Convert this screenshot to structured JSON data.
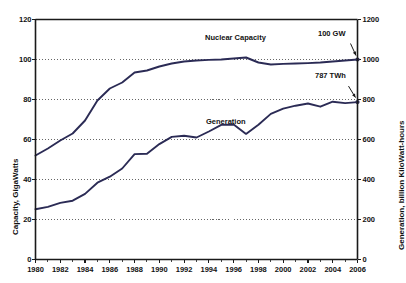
{
  "chart_data": {
    "type": "line",
    "title": "",
    "xlabel": "",
    "ylabel": "Capacity, GigaWatts",
    "ylabel_right": "Generation, billion KiloWatt-hours",
    "grid": true,
    "legend": "inline-annotations",
    "xlim": [
      1980,
      2006
    ],
    "xticks": [
      "1980",
      "1982",
      "1984",
      "1986",
      "1988",
      "1990",
      "1992",
      "1994",
      "1996",
      "1998",
      "2000",
      "2002",
      "2004",
      "2006"
    ],
    "ylim_left": [
      0,
      120
    ],
    "yticks_left": [
      "0",
      "20",
      "40",
      "60",
      "80",
      "100",
      "120"
    ],
    "ylim_right": [
      0,
      1200
    ],
    "yticks_right": [
      "0",
      "200",
      "400",
      "600",
      "800",
      "1000",
      "1200"
    ],
    "x": [
      1980,
      1981,
      1982,
      1983,
      1984,
      1985,
      1986,
      1987,
      1988,
      1989,
      1990,
      1991,
      1992,
      1993,
      1994,
      1995,
      1996,
      1997,
      1998,
      1999,
      2000,
      2001,
      2002,
      2003,
      2004,
      2005,
      2006
    ],
    "series": [
      {
        "name": "Nuclear Capacity",
        "axis": "left",
        "units": "GW",
        "color": "#2b2b55",
        "values": [
          52.0,
          55.5,
          59.5,
          63.0,
          69.5,
          79.5,
          85.5,
          88.5,
          93.5,
          94.5,
          96.5,
          98.0,
          99.0,
          99.5,
          99.8,
          100.0,
          100.5,
          101.0,
          98.5,
          97.5,
          97.8,
          98.0,
          98.2,
          98.5,
          99.0,
          99.5,
          100.0
        ],
        "endpoint_label": "100 GW"
      },
      {
        "name": "Generation",
        "axis": "right",
        "units": "TWh",
        "color": "#2b2b55",
        "values": [
          251,
          263,
          283,
          294,
          328,
          384,
          414,
          455,
          527,
          529,
          577,
          613,
          619,
          610,
          640,
          673,
          675,
          628,
          674,
          728,
          754,
          769,
          780,
          764,
          789,
          782,
          787
        ],
        "endpoint_label": "787 TWh"
      }
    ],
    "annotations": [
      {
        "text": "Nuclear Capacity",
        "kind": "series-label"
      },
      {
        "text": "Generation",
        "kind": "series-label"
      },
      {
        "text": "100 GW",
        "kind": "endpoint-callout"
      },
      {
        "text": "787 TWh",
        "kind": "endpoint-callout"
      }
    ]
  },
  "colors": {
    "line": "#2b2b55",
    "axis": "#1a1a1a",
    "grid": "#555555",
    "background": "#ffffff"
  }
}
